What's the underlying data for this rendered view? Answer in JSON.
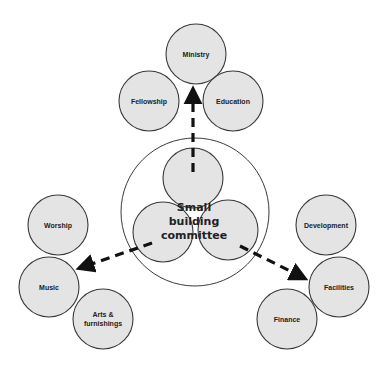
{
  "center": {
    "label_lines": [
      "Small",
      "building",
      "committee"
    ]
  },
  "groups": {
    "top": {
      "nodes": [
        "Ministry",
        "Fellowship",
        "Education"
      ],
      "arrow_target": "Ministry"
    },
    "left": {
      "nodes": [
        "Worship",
        "Music",
        "Arts &",
        "furnishings"
      ],
      "arrow_target": "Music"
    },
    "right": {
      "nodes": [
        "Development",
        "Facilities",
        "Finance"
      ],
      "arrow_target": "Facilities"
    }
  },
  "nodes": {
    "ministry": "Ministry",
    "fellowship": "Fellowship",
    "education": "Education",
    "worship": "Worship",
    "music": "Music",
    "arts_line1": "Arts &",
    "arts_line2": "furnishings",
    "development": "Development",
    "facilities": "Facilities",
    "finance": "Finance"
  },
  "colors": {
    "node_fill": "#e4e4e4",
    "stroke": "#3a3a3a",
    "arrow": "#111111"
  }
}
